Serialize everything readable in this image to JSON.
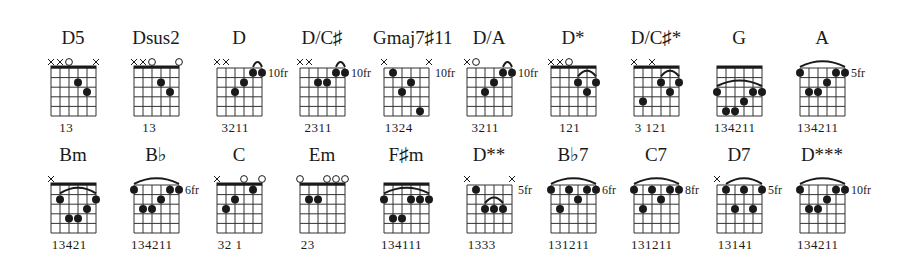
{
  "diagram": {
    "type": "guitar-chord-chart",
    "strings": 6,
    "frets_shown": 5,
    "rows": [
      {
        "chords": [
          {
            "name": "D5",
            "markers": [
              "x",
              "x",
              "o",
              "",
              "",
              "x"
            ],
            "nut": true,
            "position": "",
            "dots": [
              [
                3,
                2
              ],
              [
                4,
                3
              ]
            ],
            "barres": [],
            "fingers": "   13"
          },
          {
            "name": "Dsus2",
            "markers": [
              "x",
              "x",
              "o",
              "",
              "",
              "o"
            ],
            "nut": true,
            "position": "",
            "dots": [
              [
                3,
                2
              ],
              [
                4,
                3
              ]
            ],
            "barres": [],
            "fingers": "   13"
          },
          {
            "name": "D",
            "markers": [
              "x",
              "x",
              "",
              "",
              "",
              ""
            ],
            "nut": false,
            "position": "10fr",
            "dots": [
              [
                2,
                3
              ],
              [
                3,
                2
              ],
              [
                4,
                1
              ],
              [
                5,
                1
              ]
            ],
            "barres": [
              [
                4,
                5,
                1,
                "small"
              ]
            ],
            "fingers": "  3211"
          },
          {
            "name": "D/C♯",
            "markers": [
              "x",
              "x",
              "",
              "",
              "",
              ""
            ],
            "nut": false,
            "position": "10fr",
            "dots": [
              [
                2,
                2
              ],
              [
                3,
                2
              ],
              [
                4,
                1
              ],
              [
                5,
                1
              ]
            ],
            "barres": [
              [
                4,
                5,
                1,
                "small"
              ]
            ],
            "fingers": "  2311"
          },
          {
            "name": "Gmaj7♯11",
            "markers": [
              "x",
              "",
              "",
              "",
              "",
              "x"
            ],
            "nut": false,
            "position": "10fr",
            "dots": [
              [
                1,
                1
              ],
              [
                2,
                3
              ],
              [
                3,
                2
              ],
              [
                4,
                5
              ]
            ],
            "barres": [],
            "fingers": " 1324"
          },
          {
            "name": "D/A",
            "markers": [
              "x",
              "o",
              "",
              "",
              "",
              ""
            ],
            "nut": false,
            "position": "10fr",
            "dots": [
              [
                2,
                3
              ],
              [
                3,
                2
              ],
              [
                4,
                1
              ],
              [
                5,
                1
              ]
            ],
            "barres": [
              [
                4,
                5,
                1,
                "small"
              ]
            ],
            "fingers": "  3211"
          },
          {
            "name": "D*",
            "markers": [
              "x",
              "x",
              "o",
              "",
              "",
              ""
            ],
            "nut": true,
            "position": "",
            "dots": [
              [
                3,
                2
              ],
              [
                4,
                3
              ],
              [
                5,
                2
              ]
            ],
            "barres": [
              [
                3,
                5,
                2,
                "arc"
              ]
            ],
            "fingers": "   121"
          },
          {
            "name": "D/C♯*",
            "markers": [
              "x",
              "",
              "x",
              "",
              "",
              ""
            ],
            "nut": true,
            "position": "",
            "dots": [
              [
                1,
                4
              ],
              [
                3,
                2
              ],
              [
                4,
                3
              ],
              [
                5,
                2
              ]
            ],
            "barres": [
              [
                3,
                5,
                2,
                "arc"
              ]
            ],
            "fingers": " 3 121"
          },
          {
            "name": "G",
            "markers": [
              "",
              "",
              "",
              "",
              "",
              ""
            ],
            "nut": true,
            "position": "",
            "dots": [
              [
                0,
                3
              ],
              [
                1,
                5
              ],
              [
                2,
                5
              ],
              [
                3,
                4
              ],
              [
                4,
                3
              ],
              [
                5,
                3
              ]
            ],
            "barres": [
              [
                0,
                5,
                3,
                "arc"
              ]
            ],
            "fingers": "134211"
          },
          {
            "name": "A",
            "markers": [
              "",
              "",
              "",
              "",
              "",
              ""
            ],
            "nut": false,
            "position": "5fr",
            "dots": [
              [
                0,
                1
              ],
              [
                1,
                3
              ],
              [
                2,
                3
              ],
              [
                3,
                2
              ],
              [
                4,
                1
              ],
              [
                5,
                1
              ]
            ],
            "barres": [
              [
                0,
                5,
                1,
                "arc"
              ]
            ],
            "fingers": "134211"
          }
        ]
      },
      {
        "chords": [
          {
            "name": "Bm",
            "markers": [
              "x",
              "",
              "",
              "",
              "",
              ""
            ],
            "nut": true,
            "position": "",
            "dots": [
              [
                1,
                2
              ],
              [
                2,
                4
              ],
              [
                3,
                4
              ],
              [
                4,
                3
              ],
              [
                5,
                2
              ]
            ],
            "barres": [
              [
                1,
                5,
                2,
                "arc"
              ]
            ],
            "fingers": " 13421"
          },
          {
            "name": "B♭",
            "markers": [
              "",
              "",
              "",
              "",
              "",
              ""
            ],
            "nut": false,
            "position": "6fr",
            "dots": [
              [
                0,
                1
              ],
              [
                1,
                3
              ],
              [
                2,
                3
              ],
              [
                3,
                2
              ],
              [
                4,
                1
              ],
              [
                5,
                1
              ]
            ],
            "barres": [
              [
                0,
                5,
                1,
                "arc"
              ]
            ],
            "fingers": "134211"
          },
          {
            "name": "C",
            "markers": [
              "x",
              "",
              "",
              "o",
              "",
              "o"
            ],
            "nut": true,
            "position": "",
            "dots": [
              [
                1,
                3
              ],
              [
                2,
                2
              ],
              [
                4,
                1
              ]
            ],
            "barres": [],
            "fingers": " 32 1"
          },
          {
            "name": "Em",
            "markers": [
              "o",
              "",
              "",
              "o",
              "o",
              "o"
            ],
            "nut": true,
            "position": "",
            "dots": [
              [
                1,
                2
              ],
              [
                2,
                2
              ]
            ],
            "barres": [],
            "fingers": " 23"
          },
          {
            "name": "F♯m",
            "markers": [
              "",
              "",
              "",
              "",
              "",
              ""
            ],
            "nut": true,
            "position": "",
            "dots": [
              [
                0,
                2
              ],
              [
                1,
                4
              ],
              [
                2,
                4
              ],
              [
                3,
                2
              ],
              [
                4,
                2
              ],
              [
                5,
                2
              ]
            ],
            "barres": [
              [
                0,
                5,
                2,
                "arc"
              ]
            ],
            "fingers": "134111"
          },
          {
            "name": "D**",
            "markers": [
              "x",
              "",
              "",
              "",
              "",
              "x"
            ],
            "nut": false,
            "position": "5fr",
            "dots": [
              [
                1,
                1
              ],
              [
                2,
                3
              ],
              [
                3,
                3
              ],
              [
                4,
                3
              ]
            ],
            "barres": [
              [
                2,
                4,
                3,
                "arc"
              ]
            ],
            "fingers": " 1333"
          },
          {
            "name": "B♭7",
            "markers": [
              "",
              "",
              "",
              "",
              "",
              ""
            ],
            "nut": false,
            "position": "6fr",
            "dots": [
              [
                0,
                1
              ],
              [
                1,
                3
              ],
              [
                2,
                1
              ],
              [
                3,
                2
              ],
              [
                4,
                1
              ],
              [
                5,
                1
              ]
            ],
            "barres": [
              [
                0,
                5,
                1,
                "arc"
              ]
            ],
            "fingers": "131211"
          },
          {
            "name": "C7",
            "markers": [
              "",
              "",
              "",
              "",
              "",
              ""
            ],
            "nut": false,
            "position": "8fr",
            "dots": [
              [
                0,
                1
              ],
              [
                1,
                3
              ],
              [
                2,
                1
              ],
              [
                3,
                2
              ],
              [
                4,
                1
              ],
              [
                5,
                1
              ]
            ],
            "barres": [
              [
                0,
                5,
                1,
                "arc"
              ]
            ],
            "fingers": "131211"
          },
          {
            "name": "D7",
            "markers": [
              "x",
              "",
              "",
              "",
              "",
              ""
            ],
            "nut": false,
            "position": "5fr",
            "dots": [
              [
                1,
                1
              ],
              [
                2,
                3
              ],
              [
                3,
                1
              ],
              [
                4,
                3
              ],
              [
                5,
                1
              ]
            ],
            "barres": [
              [
                1,
                5,
                1,
                "arc"
              ]
            ],
            "fingers": " 13141"
          },
          {
            "name": "D***",
            "markers": [
              "",
              "",
              "",
              "",
              "",
              ""
            ],
            "nut": false,
            "position": "10fr",
            "dots": [
              [
                0,
                1
              ],
              [
                1,
                3
              ],
              [
                2,
                3
              ],
              [
                3,
                2
              ],
              [
                4,
                1
              ],
              [
                5,
                1
              ]
            ],
            "barres": [
              [
                0,
                5,
                1,
                "arc"
              ]
            ],
            "fingers": "134211"
          }
        ]
      }
    ]
  },
  "layout": {
    "row_tops": [
      28,
      145
    ],
    "col_lefts": [
      51,
      134,
      217,
      300,
      384,
      467,
      551,
      634,
      717,
      800
    ],
    "grid_offset_y": 40,
    "string_spacing": 9,
    "fret_spacing": 9.6,
    "ink_color": "#1a1a1a",
    "grid_color": "#333333"
  }
}
